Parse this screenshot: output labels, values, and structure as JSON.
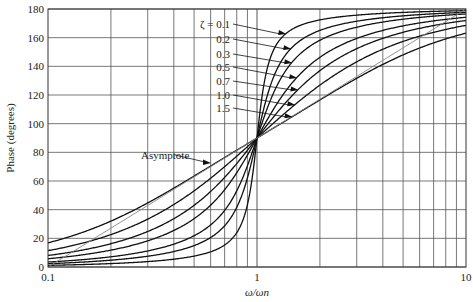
{
  "chart_data": {
    "type": "line",
    "title": "",
    "xlabel": "ω/ωn",
    "ylabel": "Phase (degrees)",
    "xscale": "log",
    "xlim": [
      0.1,
      10
    ],
    "ylim": [
      0,
      180
    ],
    "x_ticks": [
      "0.1",
      "1",
      "10"
    ],
    "y_ticks": [
      0,
      20,
      40,
      60,
      80,
      100,
      120,
      140,
      160,
      180
    ],
    "grid": true,
    "legend": "annotations with arrows",
    "zeta_label_prefix": "ζ = ",
    "series": [
      {
        "name": "0.1",
        "zeta": 0.1
      },
      {
        "name": "0.2",
        "zeta": 0.2
      },
      {
        "name": "0.3",
        "zeta": 0.3
      },
      {
        "name": "0.5",
        "zeta": 0.5
      },
      {
        "name": "0.7",
        "zeta": 0.7
      },
      {
        "name": "1.0",
        "zeta": 1.0
      },
      {
        "name": "1.5",
        "zeta": 1.5
      }
    ],
    "sample_values": {
      "x": [
        0.1,
        0.5,
        1,
        2,
        10
      ],
      "zeta_0.1": [
        1.2,
        7.6,
        90,
        172.4,
        178.8
      ],
      "zeta_1.0": [
        11.4,
        53.1,
        90,
        126.9,
        168.6
      ],
      "zeta_1.5": [
        16.9,
        63.4,
        90,
        116.6,
        163.1
      ]
    },
    "asymptote": {
      "label": "Asymptote",
      "points": [
        [
          0.1,
          0
        ],
        [
          1,
          90
        ],
        [
          10,
          180
        ]
      ]
    }
  }
}
